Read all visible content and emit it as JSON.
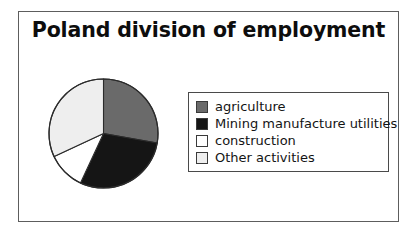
{
  "chart_data": {
    "type": "pie",
    "title": "Poland division of employment",
    "subtitle": "",
    "xlabel": "",
    "ylabel": "",
    "legend_position": "right",
    "grid": false,
    "categories": [
      "agriculture",
      "Mining manufacture utilities",
      "construction",
      "Other activities"
    ],
    "values": [
      28,
      29,
      11,
      32
    ],
    "units": "percent",
    "start_angle_deg": 0,
    "direction": "clockwise",
    "slices": [
      {
        "label": "agriculture",
        "value": 28,
        "color": "#6a6a6a",
        "start_angle_deg": 0,
        "end_angle_deg": 100
      },
      {
        "label": "Mining manufacture utilities",
        "value": 29,
        "color": "#151515",
        "start_angle_deg": 100,
        "end_angle_deg": 205
      },
      {
        "label": "construction",
        "value": 11,
        "color": "#ffffff",
        "start_angle_deg": 205,
        "end_angle_deg": 245
      },
      {
        "label": "Other activities",
        "value": 32,
        "color": "#eeeeee",
        "start_angle_deg": 245,
        "end_angle_deg": 360
      }
    ]
  },
  "figure": {
    "title": "Poland division of employment",
    "frame_color": "#5d5d5d",
    "background": "#ffffff",
    "outline_color": "#2b2b2b"
  },
  "legend": {
    "border_color": "#4a4a4a",
    "items": [
      {
        "label": "agriculture",
        "color": "#6a6a6a"
      },
      {
        "label": "Mining manufacture utilities",
        "color": "#151515"
      },
      {
        "label": "construction",
        "color": "#ffffff"
      },
      {
        "label": "Other activities",
        "color": "#eeeeee"
      }
    ]
  }
}
